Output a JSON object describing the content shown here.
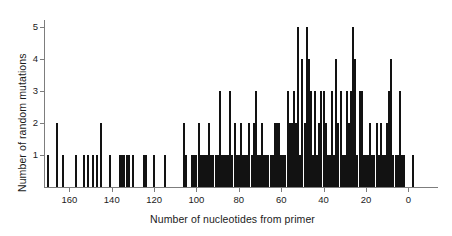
{
  "chart_data": {
    "type": "bar",
    "title": "",
    "subtitle": "",
    "xlabel": "Number of nucleotides from primer",
    "ylabel": "Number of random mutations",
    "xlim": [
      172,
      -6
    ],
    "ylim": [
      0,
      5.3
    ],
    "x_reversed": true,
    "xticks": [
      160,
      140,
      120,
      100,
      80,
      60,
      40,
      20,
      0
    ],
    "xtick_labels": [
      "160",
      "140",
      "120",
      "100",
      "80",
      "60",
      "40",
      "20",
      "0"
    ],
    "yticks": [
      1,
      2,
      3,
      4,
      5
    ],
    "ytick_labels": [
      "1",
      "2",
      "3",
      "4",
      "5"
    ],
    "grid": false,
    "legend": null,
    "bar_color": "#121212",
    "axis_color": "#7d7d7d",
    "note": "Histogram of random mutation counts per nucleotide position measured from the primer; x axis runs from 170 (left) down to 0 (right).",
    "x": [
      170,
      166,
      163,
      157,
      153,
      151,
      149,
      147,
      145,
      141,
      136,
      135,
      134,
      133,
      132,
      130,
      125,
      124,
      120,
      115,
      106,
      105,
      102,
      101,
      100,
      99,
      98,
      97,
      96,
      95,
      94,
      93,
      92,
      91,
      90,
      89,
      88,
      87,
      86,
      85,
      84,
      83,
      82,
      81,
      80,
      79,
      78,
      77,
      76,
      75,
      74,
      73,
      72,
      71,
      70,
      69,
      68,
      67,
      66,
      65,
      64,
      63,
      62,
      61,
      60,
      59,
      58,
      57,
      56,
      55,
      54,
      53,
      52,
      51,
      50,
      49,
      48,
      47,
      46,
      45,
      44,
      43,
      42,
      41,
      40,
      39,
      38,
      37,
      36,
      35,
      34,
      33,
      32,
      31,
      30,
      29,
      28,
      27,
      26,
      25,
      24,
      23,
      22,
      21,
      20,
      19,
      18,
      17,
      16,
      15,
      14,
      13,
      12,
      11,
      10,
      9,
      8,
      7,
      6,
      5,
      4,
      3,
      2,
      -2
    ],
    "values": [
      1,
      2,
      1,
      1,
      1,
      1,
      1,
      1,
      2,
      1,
      1,
      1,
      1,
      1,
      1,
      1,
      1,
      1,
      1,
      1,
      2,
      1,
      1,
      1,
      1,
      2,
      1,
      1,
      1,
      1,
      2,
      1,
      1,
      1,
      1,
      3,
      1,
      1,
      1,
      1,
      3,
      1,
      2,
      1,
      1,
      2,
      1,
      1,
      1,
      2,
      1,
      2,
      3,
      1,
      1,
      2,
      1,
      1,
      1,
      1,
      1,
      2,
      2,
      2,
      1,
      1,
      1,
      3,
      2,
      2,
      3,
      2,
      5,
      1,
      4,
      2,
      5,
      4,
      3,
      1,
      3,
      1,
      2,
      3,
      3,
      2,
      1,
      1,
      3,
      1,
      4,
      2,
      3,
      1,
      1,
      3,
      2,
      3,
      5,
      4,
      1,
      3,
      3,
      1,
      1,
      1,
      2,
      1,
      1,
      2,
      1,
      2,
      1,
      1,
      2,
      3,
      4,
      1,
      1,
      1,
      3,
      1,
      1,
      1
    ]
  },
  "axes": {
    "plot_left_px": 44,
    "plot_right_px": 421,
    "baseline_px": 187,
    "unit_px": 32.0
  }
}
